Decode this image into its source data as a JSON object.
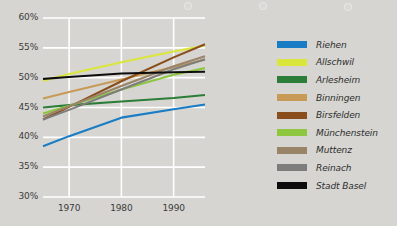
{
  "chart_data": {
    "type": "line",
    "title": "",
    "xlabel": "",
    "ylabel": "",
    "xlim": [
      1965,
      1996
    ],
    "ylim": [
      30,
      60
    ],
    "grid": true,
    "grid_color": "#ffffff",
    "background": "#d6d5d1",
    "legend_position": "right",
    "x_ticks": [
      1970,
      1980,
      1990
    ],
    "x_tick_labels": [
      "1970",
      "1980",
      "1990"
    ],
    "y_ticks": [
      30,
      35,
      40,
      45,
      50,
      55,
      60
    ],
    "y_tick_labels": [
      "30%",
      "35%",
      "40%",
      "45%",
      "50%",
      "55%",
      "60%"
    ],
    "series": [
      {
        "name": "Riehen",
        "color": "#1a7cc4",
        "x": [
          1965,
          1970,
          1980,
          1990,
          1996
        ],
        "values": [
          38.5,
          40.2,
          43.3,
          44.7,
          45.5
        ]
      },
      {
        "name": "Allschwil",
        "color": "#dbe63c",
        "x": [
          1965,
          1970,
          1980,
          1990,
          1996
        ],
        "values": [
          49.5,
          50.6,
          52.6,
          54.4,
          55.4
        ]
      },
      {
        "name": "Arlesheim",
        "color": "#2c7d38",
        "x": [
          1965,
          1970,
          1980,
          1990,
          1996
        ],
        "values": [
          45.0,
          45.4,
          46.0,
          46.6,
          47.1
        ]
      },
      {
        "name": "Binningen",
        "color": "#c79a58",
        "x": [
          1965,
          1970,
          1980,
          1990,
          1996
        ],
        "values": [
          46.5,
          47.6,
          49.7,
          51.8,
          53.0
        ]
      },
      {
        "name": "Birsfelden",
        "color": "#8a4e1c",
        "x": [
          1965,
          1970,
          1980,
          1990,
          1996
        ],
        "values": [
          43.0,
          45.1,
          49.4,
          53.4,
          55.6
        ]
      },
      {
        "name": "Münchenstein",
        "color": "#8ec63f",
        "x": [
          1965,
          1970,
          1980,
          1990,
          1996
        ],
        "values": [
          44.0,
          45.3,
          48.0,
          50.5,
          51.6
        ]
      },
      {
        "name": "Muttenz",
        "color": "#9a8468",
        "x": [
          1965,
          1970,
          1980,
          1990,
          1996
        ],
        "values": [
          43.5,
          45.2,
          48.6,
          51.9,
          53.6
        ]
      },
      {
        "name": "Reinach",
        "color": "#7d7d7b",
        "x": [
          1965,
          1970,
          1980,
          1990,
          1996
        ],
        "values": [
          43.0,
          44.6,
          48.0,
          51.4,
          53.1
        ]
      },
      {
        "name": "Stadt Basel",
        "color": "#0d0d0d",
        "x": [
          1965,
          1970,
          1980,
          1990,
          1996
        ],
        "values": [
          49.8,
          50.1,
          50.7,
          50.9,
          51.0
        ]
      }
    ]
  },
  "legend": {
    "items": [
      {
        "label": "Riehen",
        "color": "#1a7cc4"
      },
      {
        "label": "Allschwil",
        "color": "#dbe63c"
      },
      {
        "label": "Arlesheim",
        "color": "#2c7d38"
      },
      {
        "label": "Binningen",
        "color": "#c79a58"
      },
      {
        "label": "Birsfelden",
        "color": "#8a4e1c"
      },
      {
        "label": "Münchenstein",
        "color": "#8ec63f"
      },
      {
        "label": "Muttenz",
        "color": "#9a8468"
      },
      {
        "label": "Reinach",
        "color": "#7d7d7b"
      },
      {
        "label": "Stadt Basel",
        "color": "#0d0d0d"
      }
    ]
  }
}
